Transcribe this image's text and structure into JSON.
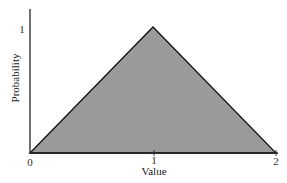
{
  "chart_data": {
    "type": "area",
    "title": "",
    "xlabel": "Value",
    "ylabel": "Probability",
    "x": [
      0,
      1,
      2
    ],
    "y": [
      0,
      1,
      0
    ],
    "xlim": [
      0,
      2
    ],
    "ylim": [
      0,
      1.15
    ],
    "xticks": [
      "0",
      "1",
      "2"
    ],
    "yticks": [
      "1"
    ],
    "grid": false,
    "legend": null,
    "fill_color": "#9a9a9a",
    "line_color": "#111111"
  },
  "labels": {
    "xlabel": "Value",
    "ylabel": "Probability",
    "xtick0": "0",
    "xtick1": "1",
    "xtick2": "2",
    "ytick1": "1"
  }
}
